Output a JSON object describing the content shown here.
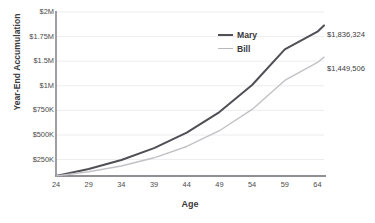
{
  "chart_data": {
    "type": "line",
    "title": "",
    "xlabel": "Age",
    "ylabel": "Year-End Accumulation",
    "xlim": [
      24,
      65
    ],
    "ylim": [
      0,
      2000000
    ],
    "grid": true,
    "legend_position": "top-right",
    "x_tick_labels": [
      "24",
      "29",
      "34",
      "39",
      "44",
      "49",
      "54",
      "59",
      "64"
    ],
    "x_ticks": [
      24,
      29,
      34,
      39,
      44,
      49,
      54,
      59,
      64
    ],
    "y_tick_labels": [
      "$2M",
      "$1.75M",
      "$1.5M",
      "$1M",
      "$750K",
      "$500K",
      "$250K"
    ],
    "y_ticks": [
      2000000,
      1750000,
      1500000,
      1250000,
      750000,
      500000,
      250000
    ],
    "series": [
      {
        "name": "Mary",
        "color": "#4f4f55",
        "end_label": "$1,836,324",
        "end_value": 1836324,
        "x": [
          24,
          29,
          34,
          39,
          44,
          49,
          54,
          59,
          64,
          65
        ],
        "values": [
          0,
          85000,
          195000,
          340000,
          530000,
          780000,
          1110000,
          1545000,
          1760000,
          1836324
        ]
      },
      {
        "name": "Bill",
        "color": "#c2c2c6",
        "end_label": "$1,449,506",
        "end_value": 1449506,
        "x": [
          24,
          29,
          34,
          39,
          44,
          49,
          54,
          59,
          64,
          65
        ],
        "values": [
          0,
          52000,
          122000,
          222000,
          360000,
          552000,
          812000,
          1165000,
          1385000,
          1449506
        ]
      }
    ]
  },
  "axes": {
    "x_title": "Age",
    "y_title": "Year-End Accumulation"
  },
  "legend": {
    "items": [
      {
        "label": "Mary"
      },
      {
        "label": "Bill"
      }
    ]
  },
  "annotations": {
    "mary_end": "$1,836,324",
    "bill_end": "$1,449,506"
  },
  "colors": {
    "mary_line": "#4f4f55",
    "bill_line": "#c2c2c6",
    "axis": "#6b6b70",
    "grid": "#ededf0",
    "text": "#3c3c3c",
    "background": "#ffffff"
  }
}
